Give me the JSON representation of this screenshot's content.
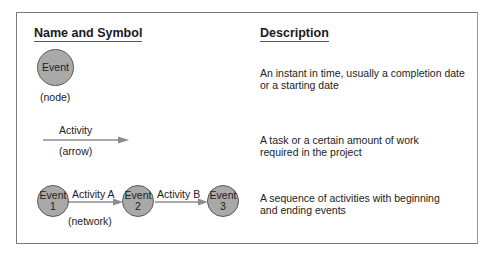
{
  "headers": {
    "name_symbol": "Name and Symbol",
    "description": "Description"
  },
  "rows": [
    {
      "symbol": {
        "node_label": "Event",
        "caption": "(node)"
      },
      "description_lines": [
        "An instant in time, usually a completion date",
        "or a starting date"
      ]
    },
    {
      "symbol": {
        "arrow_label": "Activity",
        "caption": "(arrow)"
      },
      "description_lines": [
        "A task or a certain amount of work",
        "required in the project"
      ]
    },
    {
      "symbol": {
        "nodes": [
          {
            "line1": "Event",
            "line2": "1"
          },
          {
            "line1": "Event",
            "line2": "2"
          },
          {
            "line1": "Event",
            "line2": "3"
          }
        ],
        "activities": [
          "Activity A",
          "Activity B"
        ],
        "caption": "(network)"
      },
      "description_lines": [
        "A sequence of activities with beginning",
        "and ending events"
      ]
    }
  ],
  "colors": {
    "node_fill": "#a9a9a9",
    "node_stroke": "#5a5a5a",
    "arrow": "#8c8c8c",
    "frame": "#7a7a7a"
  }
}
